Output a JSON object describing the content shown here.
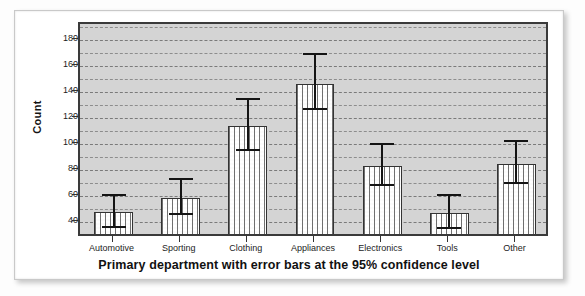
{
  "chart_data": {
    "type": "bar",
    "title": "",
    "subtitle": "",
    "xlabel": "Primary department with error bars at the 95% confidence level",
    "ylabel": "Count",
    "categories": [
      "Automotive",
      "Sporting",
      "Clothing",
      "Appliances",
      "Electronics",
      "Tools",
      "Other"
    ],
    "values": [
      48,
      59,
      114,
      146,
      83,
      47,
      85
    ],
    "error_low": [
      36,
      46,
      95,
      126,
      68,
      35,
      69
    ],
    "error_high": [
      62,
      74,
      135,
      170,
      101,
      62,
      103
    ],
    "error_type": "95% confidence interval",
    "ylim": [
      28,
      192
    ],
    "ytick_labels": [
      "40",
      "60",
      "80",
      "100",
      "120",
      "140",
      "160",
      "180"
    ],
    "ytick_values": [
      40,
      60,
      80,
      100,
      120,
      140,
      160,
      180
    ],
    "minor_gridline_step": 10,
    "grid": true,
    "legend": "none",
    "bar_fill": "dotted-pattern-white",
    "plot_background": "#d4d4d4",
    "axis_color": "#333333",
    "errorbar_color": "#141414"
  }
}
